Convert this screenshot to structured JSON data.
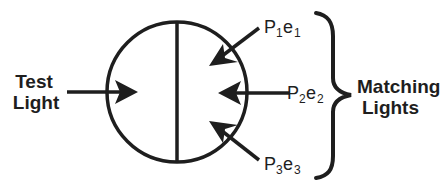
{
  "diagram": {
    "test_light": {
      "line1": "Test",
      "line2": "Light"
    },
    "matching_lights": {
      "line1": "Matching",
      "line2": "Lights"
    },
    "primaries": [
      {
        "base": "P",
        "sub1": "1",
        "mid": "e",
        "sub2": "1"
      },
      {
        "base": "P",
        "sub1": "2",
        "mid": "e",
        "sub2": "2"
      },
      {
        "base": "P",
        "sub1": "3",
        "mid": "e",
        "sub2": "3"
      }
    ],
    "colors": {
      "ink": "#1e1e1e",
      "background": "#ffffff"
    }
  }
}
